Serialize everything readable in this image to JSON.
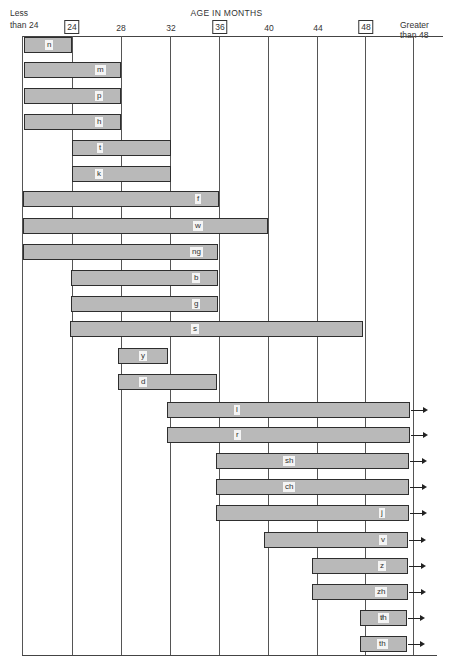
{
  "chart_data": {
    "type": "bar",
    "subtype": "horizontal-range",
    "title": "AGE IN MONTHS",
    "x_ticks": [
      "Less than 24",
      "24",
      "28",
      "32",
      "36",
      "40",
      "44",
      "48",
      "Greater than 48"
    ],
    "boxed_ticks": [
      "24",
      "36",
      "48"
    ],
    "xlabel": "AGE IN MONTHS",
    "ylabel": "",
    "categories": [
      "n",
      "m",
      "p",
      "h",
      "t",
      "k",
      "f",
      "w",
      "ng",
      "b",
      "g",
      "s",
      "y",
      "d",
      "l",
      "r",
      "sh",
      "ch",
      "j",
      "v",
      "z",
      "zh",
      "t̸h",
      "th"
    ],
    "series": [
      {
        "name": "start_months",
        "values": [
          "<24",
          "<24",
          "<24",
          "<24",
          24,
          24,
          "<24",
          "<24",
          "<24",
          24,
          24,
          24,
          28,
          28,
          32,
          32,
          36,
          36,
          36,
          40,
          44,
          44,
          48,
          48
        ]
      },
      {
        "name": "end_months",
        "values": [
          24,
          28,
          28,
          28,
          32,
          32,
          36,
          40,
          36,
          36,
          36,
          48,
          32,
          36,
          ">48",
          ">48",
          ">48",
          ">48",
          ">48",
          ">48",
          ">48",
          ">48",
          ">48",
          ">48"
        ]
      }
    ],
    "grid": true,
    "legend": "none"
  },
  "header": {
    "title": "AGE IN MONTHS",
    "less_than_line1": "Less",
    "less_than_line2": "than 24",
    "greater_than_line1": "Greater",
    "greater_than_line2": "than 48",
    "ticks": [
      "24",
      "28",
      "32",
      "36",
      "40",
      "44",
      "48"
    ]
  },
  "bars": [
    {
      "label": "n",
      "start": 24,
      "end": 72,
      "y": 37,
      "lx": 20,
      "arrow": false
    },
    {
      "label": "m",
      "start": 24,
      "end": 121,
      "y": 62,
      "lx": 70,
      "arrow": false
    },
    {
      "label": "p",
      "start": 24,
      "end": 121,
      "y": 88,
      "lx": 70,
      "arrow": false
    },
    {
      "label": "h",
      "start": 24,
      "end": 121,
      "y": 114,
      "lx": 70,
      "arrow": false
    },
    {
      "label": "t",
      "start": 72,
      "end": 171,
      "y": 140,
      "lx": 24,
      "arrow": false
    },
    {
      "label": "k",
      "start": 72,
      "end": 171,
      "y": 166,
      "lx": 22,
      "arrow": false
    },
    {
      "label": "f",
      "start": 23,
      "end": 219,
      "y": 191,
      "lx": 171,
      "arrow": false
    },
    {
      "label": "w",
      "start": 23,
      "end": 268,
      "y": 218,
      "lx": 169,
      "arrow": false
    },
    {
      "label": "ng",
      "start": 23,
      "end": 218,
      "y": 244,
      "lx": 166,
      "arrow": false
    },
    {
      "label": "b",
      "start": 71,
      "end": 218,
      "y": 270,
      "lx": 120,
      "arrow": false
    },
    {
      "label": "g",
      "start": 71,
      "end": 218,
      "y": 296,
      "lx": 120,
      "arrow": false
    },
    {
      "label": "s",
      "start": 70,
      "end": 363,
      "y": 321,
      "lx": 120,
      "arrow": false
    },
    {
      "label": "y",
      "start": 118,
      "end": 168,
      "y": 348,
      "lx": 20,
      "arrow": false
    },
    {
      "label": "d",
      "start": 118,
      "end": 217,
      "y": 374,
      "lx": 20,
      "arrow": false
    },
    {
      "label": "l",
      "start": 167,
      "end": 410,
      "y": 402,
      "lx": 66,
      "arrow": true
    },
    {
      "label": "r",
      "start": 167,
      "end": 410,
      "y": 427,
      "lx": 66,
      "arrow": true
    },
    {
      "label": "sh",
      "start": 216,
      "end": 409,
      "y": 453,
      "lx": 66,
      "arrow": true
    },
    {
      "label": "ch",
      "start": 216,
      "end": 409,
      "y": 479,
      "lx": 66,
      "arrow": true
    },
    {
      "label": "j",
      "start": 216,
      "end": 409,
      "y": 505,
      "lx": 162,
      "arrow": true
    },
    {
      "label": "v",
      "start": 264,
      "end": 408,
      "y": 532,
      "lx": 114,
      "arrow": true
    },
    {
      "label": "z",
      "start": 312,
      "end": 408,
      "y": 558,
      "lx": 65,
      "arrow": true
    },
    {
      "label": "zh",
      "start": 312,
      "end": 408,
      "y": 584,
      "lx": 62,
      "arrow": true
    },
    {
      "label": "t̸h",
      "start": 360,
      "end": 407,
      "y": 610,
      "lx": 17,
      "arrow": true
    },
    {
      "label": "th",
      "start": 360,
      "end": 407,
      "y": 636,
      "lx": 16,
      "arrow": true
    }
  ]
}
